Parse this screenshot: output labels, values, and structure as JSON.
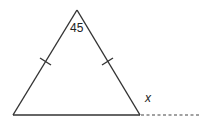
{
  "diagram": {
    "type": "geometry",
    "shape": "isosceles-triangle",
    "vertices": {
      "apex": {
        "x": 77,
        "y": 10
      },
      "bottom_left": {
        "x": 13,
        "y": 115
      },
      "bottom_right": {
        "x": 140,
        "y": 115
      }
    },
    "extension": {
      "from": {
        "x": 140,
        "y": 115
      },
      "to": {
        "x": 200,
        "y": 115
      },
      "style": "dashed"
    },
    "labels": {
      "apex_angle": "45",
      "exterior_angle": "x"
    },
    "congruence_marks": {
      "left_side": "single-tick",
      "right_side": "single-tick"
    },
    "colors": {
      "line": "#333333",
      "text": "#222222",
      "background": "#ffffff"
    }
  }
}
